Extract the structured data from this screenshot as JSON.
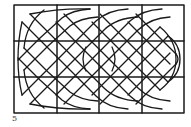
{
  "figure": {
    "label": "5",
    "grid": {
      "columns": 4,
      "rows": 3
    },
    "colors": {
      "ink": "#1a1a1a",
      "background": "#ffffff"
    }
  }
}
